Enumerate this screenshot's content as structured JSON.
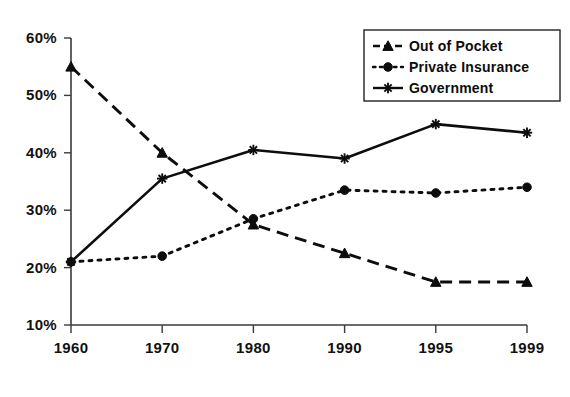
{
  "chart_data": {
    "type": "line",
    "title": "",
    "subtitle": "",
    "xlabel": "",
    "ylabel": "",
    "categories": [
      "1960",
      "1970",
      "1980",
      "1990",
      "1995",
      "1999"
    ],
    "ylim": [
      10,
      60
    ],
    "ytick_labels": [
      "10%",
      "20%",
      "30%",
      "40%",
      "50%",
      "60%"
    ],
    "ytick_values": [
      10,
      20,
      30,
      40,
      50,
      60
    ],
    "grid": false,
    "legend_position": "top-right",
    "value_suffix": "%",
    "series": [
      {
        "name": "Out of Pocket",
        "marker": "triangle",
        "line_style": "dashed",
        "color": "#0d0d0d",
        "values": [
          55,
          40,
          27.5,
          22.5,
          17.5,
          17.5
        ]
      },
      {
        "name": "Private Insurance",
        "marker": "circle",
        "line_style": "dotted",
        "color": "#0d0d0d",
        "values": [
          21,
          22,
          28.5,
          33.5,
          33,
          34
        ]
      },
      {
        "name": "Government",
        "marker": "star",
        "line_style": "solid",
        "color": "#0d0d0d",
        "values": [
          21,
          35.5,
          40.5,
          39,
          45,
          43.5
        ]
      }
    ]
  },
  "legend": {
    "items": [
      {
        "label": "Out of Pocket"
      },
      {
        "label": "Private Insurance"
      },
      {
        "label": "Government"
      }
    ]
  },
  "axes": {
    "y_ticks": [
      {
        "label": "60%"
      },
      {
        "label": "50%"
      },
      {
        "label": "40%"
      },
      {
        "label": "30%"
      },
      {
        "label": "20%"
      },
      {
        "label": "10%"
      }
    ],
    "x_ticks": [
      {
        "label": "1960"
      },
      {
        "label": "1970"
      },
      {
        "label": "1980"
      },
      {
        "label": "1990"
      },
      {
        "label": "1995"
      },
      {
        "label": "1999"
      }
    ]
  }
}
